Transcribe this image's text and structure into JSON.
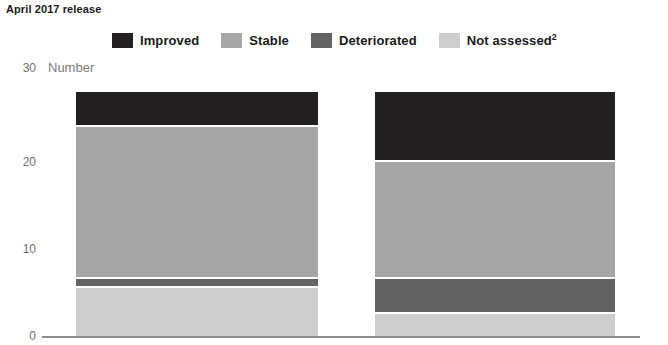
{
  "title": "April 2017 release",
  "axis": {
    "y_title": "Number",
    "ticks": [
      "0",
      "10",
      "20",
      "30"
    ]
  },
  "legend": {
    "items": [
      {
        "label": "Improved",
        "sup": "",
        "color": "#231f20",
        "key": "improved"
      },
      {
        "label": "Stable",
        "sup": "",
        "color": "#a6a6a6",
        "key": "stable"
      },
      {
        "label": "Deteriorated",
        "sup": "",
        "color": "#636363",
        "key": "deteriorated"
      },
      {
        "label": "Not assessed",
        "sup": "2",
        "color": "#cdcdcd",
        "key": "not_assessed"
      }
    ]
  },
  "chart_data": {
    "type": "bar",
    "title": "April 2017 release",
    "subtype": "stacked-vertical",
    "xlabel": "",
    "ylabel": "Number",
    "ylim": [
      0,
      30
    ],
    "yticks": [
      0,
      10,
      20,
      30
    ],
    "grid": false,
    "legend_position": "top-center",
    "categories": [
      "Bar 1",
      "Bar 2"
    ],
    "stack_order_bottom_to_top": [
      "Not assessed",
      "Deteriorated",
      "Stable",
      "Improved"
    ],
    "series": [
      {
        "name": "Improved",
        "color": "#231f20",
        "values": [
          4,
          8
        ]
      },
      {
        "name": "Stable",
        "color": "#a6a6a6",
        "values": [
          17.5,
          13.5
        ]
      },
      {
        "name": "Deteriorated",
        "color": "#636363",
        "values": [
          1,
          4
        ]
      },
      {
        "name": "Not assessed",
        "color": "#cdcdcd",
        "values": [
          5.5,
          2.5
        ]
      }
    ],
    "totals": [
      28,
      28
    ],
    "notes": [
      "2 = Not assessed"
    ]
  }
}
